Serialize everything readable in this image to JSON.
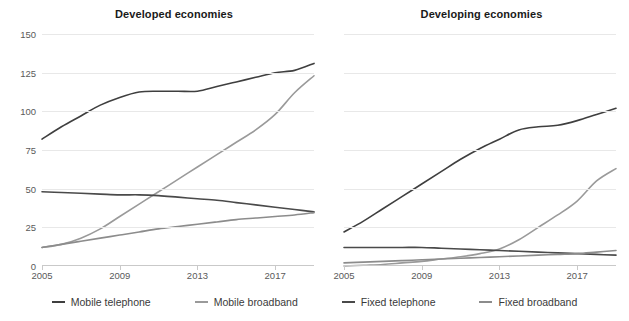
{
  "figure": {
    "cut_off_header_text": "",
    "axis_color": "#c9c9c9",
    "grid_color": "#e8e8e8"
  },
  "legend": {
    "position": "bottom",
    "items": [
      {
        "label": "Mobile telephone",
        "color": "#3f3f3f"
      },
      {
        "label": "Mobile broadband",
        "color": "#9a9a9a"
      },
      {
        "label": "Fixed telephone",
        "color": "#4a4a4a"
      },
      {
        "label": "Fixed broadband",
        "color": "#8c8c8c"
      }
    ]
  },
  "panels": [
    {
      "title": "Developed economies"
    },
    {
      "title": "Developing economies"
    }
  ],
  "axis": {
    "y_ticks": [
      "0",
      "25",
      "50",
      "75",
      "100",
      "125",
      "150"
    ],
    "x_ticks": [
      "2005",
      "2009",
      "2013",
      "2017"
    ],
    "y_min": 0,
    "y_max": 150,
    "x_min": 2005,
    "x_max": 2019
  },
  "chart_data": [
    {
      "type": "line",
      "title": "Developed economies",
      "xlabel": "",
      "ylabel": "",
      "xlim": [
        2005,
        2019
      ],
      "ylim": [
        0,
        150
      ],
      "grid": true,
      "legend": "bottom",
      "x": [
        2005,
        2006,
        2007,
        2008,
        2009,
        2010,
        2011,
        2012,
        2013,
        2014,
        2015,
        2016,
        2017,
        2018,
        2019
      ],
      "series": [
        {
          "name": "Mobile telephone",
          "color": "#3f3f3f",
          "values": [
            82,
            90,
            97,
            104,
            109,
            112.5,
            113,
            113,
            113,
            116,
            119,
            122,
            125,
            126.5,
            131
          ]
        },
        {
          "name": "Mobile broadband",
          "color": "#9a9a9a",
          "values": [
            12,
            14,
            18,
            24,
            32,
            40,
            48,
            56,
            64,
            72,
            80,
            88,
            98,
            112,
            123
          ]
        },
        {
          "name": "Fixed telephone",
          "color": "#4a4a4a",
          "values": [
            48,
            47.5,
            47,
            46.5,
            46,
            46,
            45.5,
            44.5,
            43.5,
            42.5,
            41,
            39.5,
            38,
            36.5,
            35
          ]
        },
        {
          "name": "Fixed broadband",
          "color": "#8c8c8c",
          "values": [
            12,
            14,
            16,
            18,
            20,
            22,
            24,
            25.5,
            27,
            28.5,
            30,
            31,
            32,
            33,
            34.5
          ]
        }
      ]
    },
    {
      "type": "line",
      "title": "Developing economies",
      "xlabel": "",
      "ylabel": "",
      "xlim": [
        2005,
        2019
      ],
      "ylim": [
        0,
        150
      ],
      "grid": true,
      "legend": "bottom",
      "x": [
        2005,
        2006,
        2007,
        2008,
        2009,
        2010,
        2011,
        2012,
        2013,
        2014,
        2015,
        2016,
        2017,
        2018,
        2019
      ],
      "series": [
        {
          "name": "Mobile telephone",
          "color": "#3f3f3f",
          "values": [
            22,
            29,
            37,
            45,
            53,
            61,
            69,
            76,
            82,
            88,
            90,
            91,
            94,
            98,
            102
          ]
        },
        {
          "name": "Mobile broadband",
          "color": "#9a9a9a",
          "values": [
            0,
            0.5,
            1,
            2,
            3,
            4.5,
            6,
            8,
            11,
            17,
            25,
            33,
            42,
            55,
            63
          ]
        },
        {
          "name": "Fixed telephone",
          "color": "#4a4a4a",
          "values": [
            12,
            12,
            12,
            12,
            12,
            11.5,
            11,
            10.5,
            10,
            9.5,
            9,
            8.5,
            8,
            7.5,
            7
          ]
        },
        {
          "name": "Fixed broadband",
          "color": "#8c8c8c",
          "values": [
            2,
            2.5,
            3,
            3.5,
            4,
            4.5,
            5,
            5.5,
            6,
            6.5,
            7,
            7.5,
            8,
            9,
            10
          ]
        }
      ]
    }
  ]
}
